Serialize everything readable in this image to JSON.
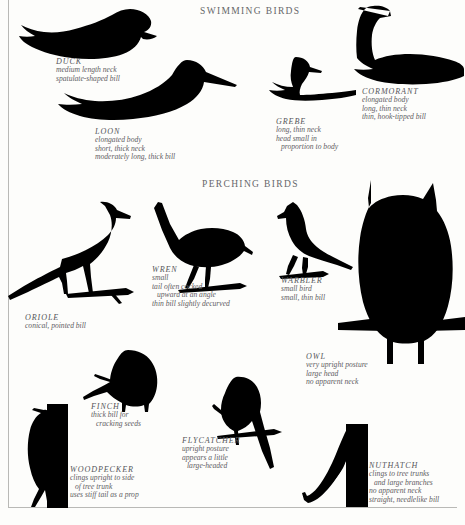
{
  "plate": {
    "title_swimming": "SWIMMING BIRDS",
    "title_perching": "PERCHING BIRDS",
    "ink_color": "#000000",
    "text_color": "#5f6063",
    "background": "#fdfdfb"
  },
  "swimming": {
    "duck": {
      "name": "DUCK",
      "l1": "medium length neck",
      "l2": "spatulate-shaped bill",
      "icon": "duck-silhouette"
    },
    "loon": {
      "name": "LOON",
      "l1": "elongated body",
      "l2": "short, thick neck",
      "l3": "moderately long, thick bill",
      "icon": "loon-silhouette"
    },
    "grebe": {
      "name": "GREBE",
      "l1": "long, thin neck",
      "l2": "head small in",
      "l3": "proportion to body",
      "icon": "grebe-silhouette"
    },
    "cormorant": {
      "name": "CORMORANT",
      "l1": "elongated body",
      "l2": "long, thin neck",
      "l3": "thin, hook-tipped bill",
      "icon": "cormorant-silhouette"
    }
  },
  "perching": {
    "oriole": {
      "name": "ORIOLE",
      "l1": "conical, pointed bill",
      "icon": "oriole-silhouette"
    },
    "wren": {
      "name": "WREN",
      "l1": "small",
      "l2": "tail often cocked",
      "l3": "upward at an angle",
      "l4": "thin bill slightly decurved",
      "icon": "wren-silhouette"
    },
    "warbler": {
      "name": "WARBLER",
      "l1": "small bird",
      "l2": "small, thin bill",
      "icon": "warbler-silhouette"
    },
    "owl": {
      "name": "OWL",
      "l1": "very upright posture",
      "l2": "large head",
      "l3": "no apparent neck",
      "icon": "owl-silhouette"
    },
    "finch": {
      "name": "FINCH",
      "l1": "thick bill for",
      "l2": "cracking seeds",
      "icon": "finch-silhouette"
    },
    "flycatcher": {
      "name": "FLYCATCHER",
      "l1": "upright posture",
      "l2": "appears a little",
      "l3": "large-headed",
      "icon": "flycatcher-silhouette"
    },
    "woodpecker": {
      "name": "WOODPECKER",
      "l1": "clings upright to side",
      "l2": "of tree trunk",
      "l3": "uses stiff tail as a prop",
      "icon": "woodpecker-silhouette"
    },
    "nuthatch": {
      "name": "NUTHATCH",
      "l1": "clings to tree trunks",
      "l2": "and large branches",
      "l3": "no apparent neck",
      "l4": "straight, needlelike bill",
      "icon": "nuthatch-silhouette"
    }
  }
}
